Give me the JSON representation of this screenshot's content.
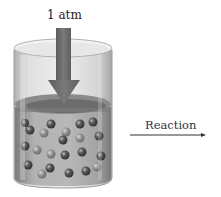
{
  "diagram": {
    "pressure_label": "1 atm",
    "process_label": "Reaction",
    "elements": {
      "container": "open glass cylinder",
      "contents": "liquid with dispersed spherical particles",
      "pressure_arrow": "downward arrow pressing on liquid surface",
      "process_arrow": "rightward arrow"
    },
    "colors": {
      "arrow": "#6e6e6e",
      "liquid": "#9a9a9a",
      "particle": "#4a4a4a",
      "glass": "#c8c8c8"
    }
  }
}
